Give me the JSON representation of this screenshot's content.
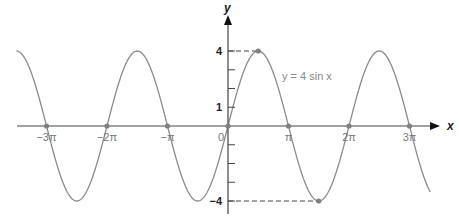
{
  "chart_data": {
    "type": "line",
    "title": "",
    "function": "y = 4 sin x",
    "annotation": "y = 4 sin x",
    "xlabel": "x",
    "ylabel": "y",
    "x_ticks": [
      {
        "value": -9.4248,
        "label": "−3π"
      },
      {
        "value": -6.2832,
        "label": "−2π"
      },
      {
        "value": -3.1416,
        "label": "−π"
      },
      {
        "value": 0,
        "label": "0"
      },
      {
        "value": 3.1416,
        "label": "π"
      },
      {
        "value": 6.2832,
        "label": "2π"
      },
      {
        "value": 9.4248,
        "label": "3π"
      }
    ],
    "y_ticks": [
      {
        "value": 4,
        "label": "4"
      },
      {
        "value": 3,
        "label": ""
      },
      {
        "value": 2,
        "label": ""
      },
      {
        "value": 1,
        "label": "1"
      },
      {
        "value": -1,
        "label": ""
      },
      {
        "value": -2,
        "label": ""
      },
      {
        "value": -3,
        "label": ""
      },
      {
        "value": -4,
        "label": "−4"
      }
    ],
    "xlim": [
      -10.99,
      10.5
    ],
    "ylim": [
      -4,
      4
    ],
    "amplitude": 4,
    "marked_points": [
      {
        "x": -9.4248,
        "y": 0
      },
      {
        "x": -6.2832,
        "y": 0
      },
      {
        "x": -3.1416,
        "y": 0
      },
      {
        "x": 0,
        "y": 0
      },
      {
        "x": 1.5708,
        "y": 4
      },
      {
        "x": 3.1416,
        "y": 0
      },
      {
        "x": 4.7124,
        "y": -4
      },
      {
        "x": 6.2832,
        "y": 0
      },
      {
        "x": 9.4248,
        "y": 0
      }
    ],
    "dashed_guides": [
      {
        "from": [
          0,
          4
        ],
        "to": [
          1.5708,
          4
        ]
      },
      {
        "from": [
          0,
          -4
        ],
        "to": [
          4.7124,
          -4
        ]
      }
    ],
    "grid": false,
    "legend": null,
    "colors": {
      "curve": "#8a8a8a",
      "axis": "#333333",
      "points": "#808080"
    }
  }
}
